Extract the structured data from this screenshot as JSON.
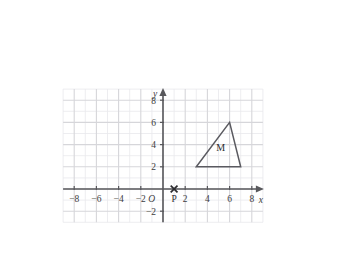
{
  "chart_data": {
    "type": "scatter",
    "title": "",
    "xlabel": "x",
    "ylabel": "y",
    "xlim": [
      -9,
      9
    ],
    "ylim": [
      -3,
      9
    ],
    "grid": true,
    "grid_step": 1,
    "legend": "none",
    "origin_label": "O",
    "x_ticks": [
      -8,
      -6,
      -4,
      -2,
      2,
      4,
      6,
      8
    ],
    "x_tick_labels": [
      "−8",
      "−6",
      "−4",
      "−2",
      "2",
      "4",
      "6",
      "8"
    ],
    "y_ticks": [
      -2,
      2,
      4,
      6,
      8
    ],
    "y_tick_labels": [
      "−2",
      "2",
      "4",
      "6",
      "8"
    ],
    "shapes": [
      {
        "name": "M",
        "kind": "polygon",
        "label": "M",
        "label_position": [
          5.2,
          3.4
        ],
        "vertices": [
          [
            3,
            2
          ],
          [
            7,
            2
          ],
          [
            6,
            6
          ]
        ]
      }
    ],
    "points": [
      {
        "name": "P",
        "label": "P",
        "marker": "x",
        "coordinates": [
          1,
          0
        ],
        "label_position": [
          1,
          -0.55
        ]
      }
    ]
  },
  "axes": {
    "x_axis_name": "x",
    "y_axis_name": "y",
    "origin": "O"
  }
}
